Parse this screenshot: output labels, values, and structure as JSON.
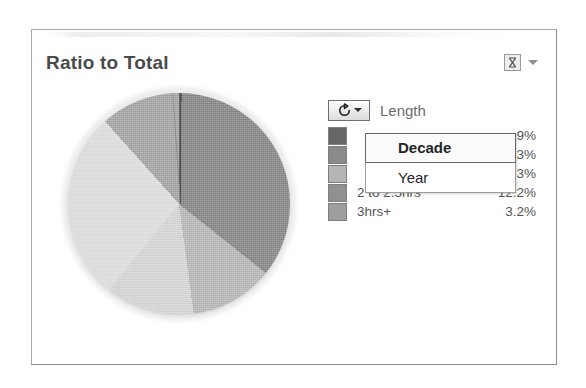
{
  "card": {
    "title": "Ratio to Total",
    "header_icon": "filter-icon",
    "header_chevron_icon": "chevron-down-icon"
  },
  "legend": {
    "button_icon": "rotate-refresh-icon",
    "button_caret_icon": "caret-down-icon",
    "title": "Length",
    "rows": [
      {
        "label": "",
        "value": ".9%",
        "color": "#666666",
        "occluded": true
      },
      {
        "label": "",
        "value": ".3%",
        "color": "#8a8a8a",
        "occluded": true
      },
      {
        "label": "",
        "value": "3%",
        "color": "#b5b5b5",
        "occluded": true
      },
      {
        "label": "2 to 2.5hrs",
        "value": "12.2%",
        "color": "#909090",
        "occluded": false
      },
      {
        "label": "3hrs+",
        "value": "3.2%",
        "color": "#9e9e9e",
        "occluded": false
      }
    ]
  },
  "dropdown": {
    "open": true,
    "items": [
      {
        "label": "Decade",
        "selected": true
      },
      {
        "label": "Year",
        "selected": false
      }
    ]
  },
  "chart_data": {
    "type": "pie",
    "title": "Ratio to Total",
    "legend_position": "right",
    "legend_title": "Length",
    "categories": [
      "under 1.5hrs",
      "1.5 to 2hrs",
      "2 to 2.5hrs",
      "3hrs+",
      "other"
    ],
    "values": [
      48.9,
      35.3,
      12.2,
      3.2,
      0.4
    ],
    "labels": [
      ".9%",
      ".3%",
      "3%",
      "12.2%",
      "3.2%"
    ],
    "colors": [
      "#d9d9d9",
      "#8f8f8f",
      "#b0b0b0",
      "#6b6b6b",
      "#555555"
    ],
    "slices": [
      {
        "label": "",
        "percent": 0.4,
        "color": "#555555",
        "start_deg": 0,
        "end_deg": 1.4
      },
      {
        "label": "",
        "percent": 35.3,
        "color": "#7e7e7e",
        "start_deg": 1.4,
        "end_deg": 128.5
      },
      {
        "label": "2 to 2.5hrs",
        "percent": 12.2,
        "color": "#b0b0b0",
        "start_deg": 128.5,
        "end_deg": 172.4
      },
      {
        "label": "3hrs+",
        "percent": 13.0,
        "color": "#cfcfcf",
        "start_deg": 172.4,
        "end_deg": 219.2
      },
      {
        "label": "",
        "percent": 27.5,
        "color": "#d8d8d8",
        "start_deg": 219.2,
        "end_deg": 318.2
      },
      {
        "label": "",
        "percent": 11.6,
        "color": "#9d9d9d",
        "start_deg": 318.2,
        "end_deg": 360
      }
    ]
  },
  "colors": {
    "card_border": "#a9a9a9",
    "title_text": "#4a4a4a",
    "legend_text": "#555555",
    "menu_text": "#262626",
    "background": "#ffffff"
  }
}
